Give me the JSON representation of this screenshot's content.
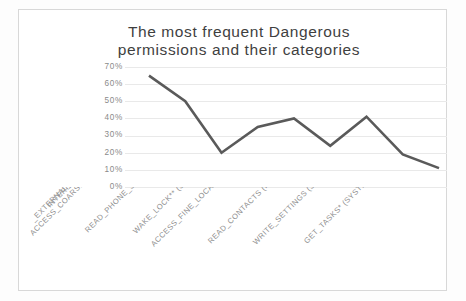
{
  "chart_data": {
    "type": "line",
    "title": "The most frequent Dangerous permissions and their categories",
    "title_lines": [
      "The most frequent Dangerous",
      "permissions and their categories"
    ],
    "xlabel": "",
    "ylabel": "",
    "ylim": [
      0,
      70
    ],
    "grid": true,
    "legend": "none",
    "line_color": "#5a5a5a",
    "categories": [
      "INTERNET** (NETWORK)",
      "_EXTERNAL_STORAGE** (STORAGE)",
      "ACCESS_COARSE_LOCATION** (LOCATION)",
      "READ_PHONE_STATE (PHONE_CALLS)",
      "WAKE_LOCK** (SYSTEM_TOOLS)",
      "ACCESS_FINE_LOCATION (LOCATION)",
      "READ_CONTACTS (PERSONAL_INFO)",
      "WRITE_SETTINGS (SYSTEM_TOOLS)",
      "GET_TASKS* (SYSTEM_TOOLS)"
    ],
    "values": [
      65,
      50,
      20,
      35,
      40,
      24,
      41,
      19,
      11
    ],
    "value_labels": [
      "65%",
      "50%",
      "20%",
      "35%",
      "40%",
      "24%",
      "41%",
      "19%",
      "11%"
    ],
    "y_ticks": [
      70,
      60,
      50,
      40,
      30,
      20,
      10,
      0
    ],
    "y_tick_labels": [
      "70%",
      "60%",
      "50%",
      "40%",
      "30%",
      "20%",
      "10%",
      "0%"
    ]
  },
  "caption": {
    "text": ""
  }
}
